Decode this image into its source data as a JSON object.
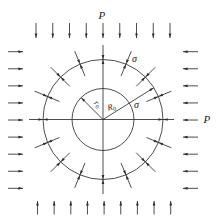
{
  "figure": {
    "labels": {
      "load_top": "P",
      "load_right": "P",
      "stress_outer": "σ",
      "stress_interface": "σ",
      "inner_radius": "r",
      "inner_radius_sub": "0",
      "outer_radius": "R",
      "outer_radius_sub": "0"
    },
    "geometry": {
      "center": [
        103,
        119.5
      ],
      "inner_radius": 31,
      "outer_radius": 60,
      "radial_arrow_count": 16,
      "load_arrows_per_side": 9,
      "outer_radius_line_angle_deg": 32,
      "inner_radius_line_angle_deg": 135
    },
    "colors": {
      "stroke": "#2e2e2e",
      "background": "#ffffff"
    }
  }
}
